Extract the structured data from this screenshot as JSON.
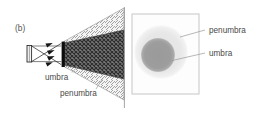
{
  "figure": {
    "panel_label": "(b)",
    "background_color": "#ffffff",
    "width": 258,
    "height": 115
  },
  "left_panel": {
    "name": "ray-diagram-panel",
    "labels": {
      "umbra": "umbra",
      "penumbra": "penumbra"
    },
    "colors": {
      "umbra_fill": "#6e6e6e",
      "penumbra_fill": "#e9e9e9",
      "obstacle": "#111111",
      "source": "#f2f2f2",
      "ray_line": "#333333",
      "screen_line": "#8d8d8d"
    },
    "elements": {
      "source_name": "extended-light-source",
      "obstacle_name": "opaque-obstacle",
      "screen_plane_name": "screen-plane-line"
    }
  },
  "right_panel": {
    "name": "shadow-screen-panel",
    "labels": {
      "penumbra": "penumbra",
      "umbra": "umbra"
    },
    "colors": {
      "screen_border": "#c9c9c9",
      "screen_fill": "#fdfdfd",
      "penumbra_fill": "#e6e6e6",
      "umbra_fill": "#9d9d9d"
    },
    "geometry": {
      "screen_x": 132,
      "screen_y": 14,
      "screen_w": 67,
      "screen_h": 80,
      "penumbra_cx": 161,
      "penumbra_cy": 52,
      "penumbra_r": 27,
      "umbra_cx": 158,
      "umbra_cy": 55,
      "umbra_r": 17
    }
  }
}
